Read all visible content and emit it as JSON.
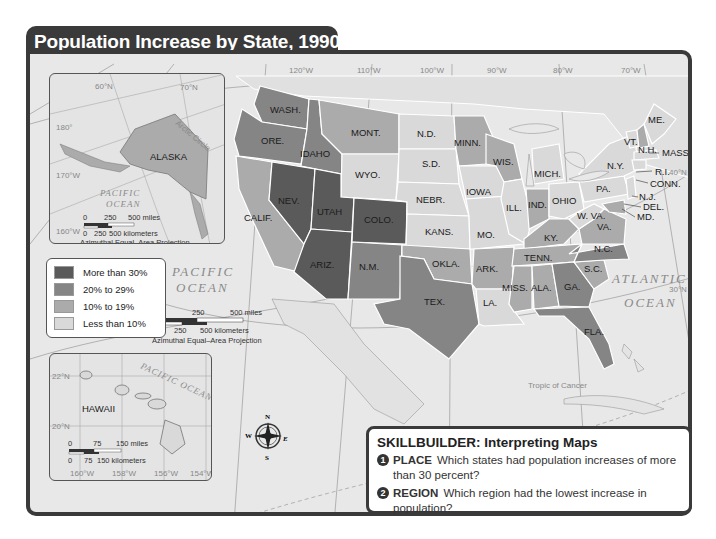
{
  "title": "Population Increase by State, 1990–2000",
  "legend": {
    "items": [
      {
        "label": "More than 30%",
        "color": "#5a5a5a"
      },
      {
        "label": "20% to 29%",
        "color": "#858585"
      },
      {
        "label": "10% to 19%",
        "color": "#ababab"
      },
      {
        "label": "Less than 10%",
        "color": "#d9d9d9"
      }
    ]
  },
  "oceans": {
    "pacific_line1": "PACIFIC",
    "pacific_line2": "OCEAN",
    "atlantic_line1": "ATLANTIC",
    "atlantic_line2": "OCEAN",
    "alaska_pacific_line1": "PACIFIC",
    "alaska_pacific_line2": "OCEAN",
    "hawaii_pacific": "PACIFIC OCEAN"
  },
  "gridlines": {
    "longitudes": [
      "120°W",
      "110°W",
      "100°W",
      "90°W",
      "80°W",
      "70°W"
    ],
    "latitudes": [
      "40°N",
      "30°N"
    ],
    "tropic": "Tropic of Cancer"
  },
  "states": [
    {
      "abbr": "WASH.",
      "category": "20% to 29%"
    },
    {
      "abbr": "ORE.",
      "category": "20% to 29%"
    },
    {
      "abbr": "CALIF.",
      "category": "10% to 19%"
    },
    {
      "abbr": "IDAHO",
      "category": "20% to 29%"
    },
    {
      "abbr": "NEV.",
      "category": "More than 30%"
    },
    {
      "abbr": "UTAH",
      "category": "More than 30%"
    },
    {
      "abbr": "ARIZ.",
      "category": "More than 30%"
    },
    {
      "abbr": "MONT.",
      "category": "10% to 19%"
    },
    {
      "abbr": "WYO.",
      "category": "Less than 10%"
    },
    {
      "abbr": "COLO.",
      "category": "More than 30%"
    },
    {
      "abbr": "N.M.",
      "category": "20% to 29%"
    },
    {
      "abbr": "N.D.",
      "category": "Less than 10%"
    },
    {
      "abbr": "S.D.",
      "category": "Less than 10%"
    },
    {
      "abbr": "NEBR.",
      "category": "Less than 10%"
    },
    {
      "abbr": "KANS.",
      "category": "Less than 10%"
    },
    {
      "abbr": "OKLA.",
      "category": "10% to 19%"
    },
    {
      "abbr": "TEX.",
      "category": "20% to 29%"
    },
    {
      "abbr": "MINN.",
      "category": "10% to 19%"
    },
    {
      "abbr": "IOWA",
      "category": "Less than 10%"
    },
    {
      "abbr": "MO.",
      "category": "Less than 10%"
    },
    {
      "abbr": "ARK.",
      "category": "10% to 19%"
    },
    {
      "abbr": "LA.",
      "category": "Less than 10%"
    },
    {
      "abbr": "WIS.",
      "category": "10% to 19%"
    },
    {
      "abbr": "ILL.",
      "category": "Less than 10%"
    },
    {
      "abbr": "MICH.",
      "category": "Less than 10%"
    },
    {
      "abbr": "IND.",
      "category": "10% to 19%"
    },
    {
      "abbr": "OHIO",
      "category": "Less than 10%"
    },
    {
      "abbr": "KY.",
      "category": "10% to 19%"
    },
    {
      "abbr": "TENN.",
      "category": "10% to 19%"
    },
    {
      "abbr": "MISS.",
      "category": "10% to 19%"
    },
    {
      "abbr": "ALA.",
      "category": "10% to 19%"
    },
    {
      "abbr": "GA.",
      "category": "20% to 29%"
    },
    {
      "abbr": "FLA.",
      "category": "20% to 29%"
    },
    {
      "abbr": "S.C.",
      "category": "10% to 19%"
    },
    {
      "abbr": "N.C.",
      "category": "20% to 29%"
    },
    {
      "abbr": "VA.",
      "category": "10% to 19%"
    },
    {
      "abbr": "W. VA.",
      "category": "Less than 10%"
    },
    {
      "abbr": "PA.",
      "category": "Less than 10%"
    },
    {
      "abbr": "N.Y.",
      "category": "Less than 10%"
    },
    {
      "abbr": "VT.",
      "category": "Less than 10%"
    },
    {
      "abbr": "N.H.",
      "category": "10% to 19%"
    },
    {
      "abbr": "ME.",
      "category": "Less than 10%"
    },
    {
      "abbr": "MASS.",
      "category": "Less than 10%"
    },
    {
      "abbr": "R.I.",
      "category": "Less than 10%"
    },
    {
      "abbr": "CONN.",
      "category": "Less than 10%"
    },
    {
      "abbr": "N.J.",
      "category": "Less than 10%"
    },
    {
      "abbr": "DEL.",
      "category": "10% to 19%"
    },
    {
      "abbr": "MD.",
      "category": "10% to 19%"
    },
    {
      "abbr": "ALASKA",
      "category": "10% to 19%"
    },
    {
      "abbr": "HAWAII",
      "category": "Less than 10%"
    }
  ],
  "alaska_inset": {
    "label": "ALASKA",
    "grid": [
      "60°N",
      "70°N",
      "180°",
      "170°W",
      "160°W"
    ],
    "arctic_circle": "Arctic Circle",
    "scale_miles": [
      "0",
      "250",
      "500 miles"
    ],
    "scale_km": [
      "0",
      "250",
      "500 kilometers"
    ],
    "projection": "Azimuthal Equal–Area Projection"
  },
  "main_scale": {
    "scale_miles": [
      "0",
      "250",
      "500 miles"
    ],
    "scale_km": [
      "0",
      "250",
      "500 kilometers"
    ],
    "projection": "Azimuthal Equal–Area Projection"
  },
  "hawaii_inset": {
    "label": "HAWAII",
    "grid_lat": [
      "22°N",
      "20°N"
    ],
    "grid_lon": [
      "160°W",
      "158°W",
      "156°W",
      "154°W"
    ],
    "scale_miles": [
      "0",
      "75",
      "150 miles"
    ],
    "scale_km": [
      "0",
      "75",
      "150 kilometers"
    ]
  },
  "compass": {
    "n": "N",
    "s": "S",
    "e": "E",
    "w": "W"
  },
  "skillbuilder": {
    "title": "SKILLBUILDER: Interpreting Maps",
    "questions": [
      {
        "num": "1",
        "keyword": "PLACE",
        "text": "Which states had population increases of more than 30 percent?"
      },
      {
        "num": "2",
        "keyword": "REGION",
        "text": "Which region had the lowest increase in population?"
      }
    ]
  }
}
